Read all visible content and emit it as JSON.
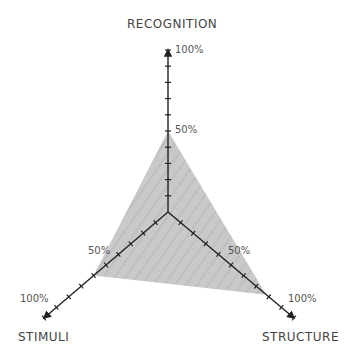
{
  "chart_data": {
    "type": "radar",
    "title": "",
    "axes": [
      "RECOGNITION",
      "STRUCTURE",
      "STIMULI"
    ],
    "values": [
      50,
      78,
      60
    ],
    "unit": "%",
    "range": [
      0,
      100
    ],
    "ticks_per_axis": 10,
    "tick_labels": [
      "50%",
      "100%"
    ],
    "fill_color": "#c4c4c4",
    "axis_color": "#222222",
    "grid": false,
    "legend": null
  },
  "labels": {
    "recognition": "RECOGNITION",
    "structure": "STRUCTURE",
    "stimuli": "STIMULI",
    "recognition_100": "100%",
    "recognition_50": "50%",
    "stimuli_100": "100%",
    "stimuli_50": "50%",
    "structure_100": "100%",
    "structure_50": "50%"
  }
}
